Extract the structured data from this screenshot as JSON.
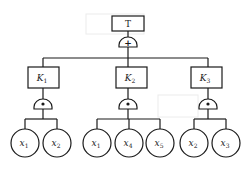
{
  "diagram": {
    "type": "fault-tree",
    "top_event": {
      "label": "T",
      "gate": "OR",
      "gate_symbol": "+"
    },
    "intermediate_events": [
      {
        "id": "K1",
        "label": "K",
        "subscript": "1",
        "gate": "AND",
        "gate_symbol": "•",
        "children": [
          "x1",
          "x2"
        ]
      },
      {
        "id": "K2",
        "label": "K",
        "subscript": "2",
        "gate": "AND",
        "gate_symbol": "•",
        "children": [
          "x1",
          "x4",
          "x5"
        ]
      },
      {
        "id": "K3",
        "label": "K",
        "subscript": "3",
        "gate": "AND",
        "gate_symbol": "•",
        "children": [
          "x2",
          "x3"
        ]
      }
    ],
    "basic_events": [
      {
        "parent": "K1",
        "label": "x",
        "subscript": "1"
      },
      {
        "parent": "K1",
        "label": "x",
        "subscript": "2"
      },
      {
        "parent": "K2",
        "label": "x",
        "subscript": "1"
      },
      {
        "parent": "K2",
        "label": "x",
        "subscript": "4"
      },
      {
        "parent": "K2",
        "label": "x",
        "subscript": "5"
      },
      {
        "parent": "K3",
        "label": "x",
        "subscript": "2"
      },
      {
        "parent": "K3",
        "label": "x",
        "subscript": "3"
      }
    ]
  }
}
